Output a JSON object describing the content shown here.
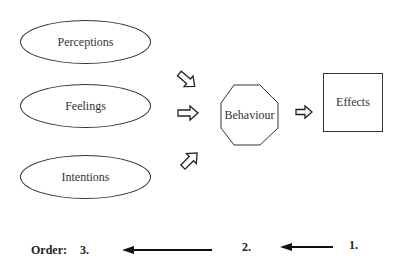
{
  "diagram": {
    "inputs": [
      {
        "label": "Perceptions"
      },
      {
        "label": "Feelings"
      },
      {
        "label": "Intentions"
      }
    ],
    "center": {
      "label": "Behaviour",
      "shape": "octagon"
    },
    "output": {
      "label": "Effects",
      "shape": "square"
    },
    "arrows": [
      "arrow-down-right",
      "arrow-right",
      "arrow-up-right",
      "arrow-right"
    ]
  },
  "order": {
    "label": "Order:",
    "steps": [
      "3.",
      "2.",
      "1."
    ]
  }
}
